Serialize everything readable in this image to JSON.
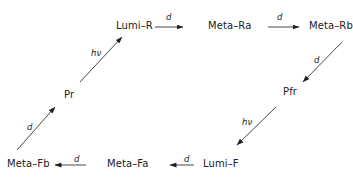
{
  "diagram": {
    "type": "reaction-cycle",
    "nodes": {
      "lumi_r": "Lumi–R",
      "meta_ra": "Meta–Ra",
      "meta_rb": "Meta–Rb",
      "pfr": "Pfr",
      "lumi_f": "Lumi–F",
      "meta_fa": "Meta–Fa",
      "meta_fb": "Meta–Fb",
      "pr": "Pr"
    },
    "edges": [
      {
        "from": "Pr",
        "to": "Lumi-R",
        "label": "hν"
      },
      {
        "from": "Lumi-R",
        "to": "Meta-Ra",
        "label": "d"
      },
      {
        "from": "Meta-Ra",
        "to": "Meta-Rb",
        "label": "d"
      },
      {
        "from": "Meta-Rb",
        "to": "Pfr",
        "label": "d"
      },
      {
        "from": "Pfr",
        "to": "Lumi-F",
        "label": "hν"
      },
      {
        "from": "Lumi-F",
        "to": "Meta-Fa",
        "label": "d"
      },
      {
        "from": "Meta-Fa",
        "to": "Meta-Fb",
        "label": "d"
      },
      {
        "from": "Meta-Fb",
        "to": "Pr",
        "label": "d"
      }
    ],
    "edge_labels": {
      "pr_lumir": "hν",
      "lumir_metara": "d",
      "metara_metarb": "d",
      "metarb_pfr": "d",
      "pfr_lumif": "hν",
      "lumif_metafa": "d",
      "metafa_metafb": "d",
      "metafb_pr": "d"
    }
  }
}
